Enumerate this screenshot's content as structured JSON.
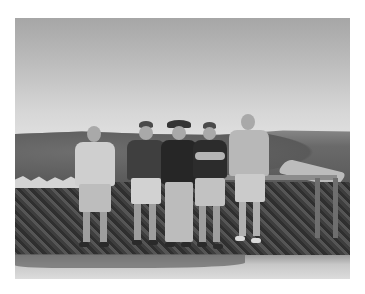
{
  "image": {
    "description": "Black-and-white photograph of five men standing in a row in front of a stone wall and wooden railing at a scenic overlook, with wooded hills and a river valley behind them under a bright hazy sky.",
    "color_mode": "grayscale",
    "scene": {
      "sky": "hazy, bright, gradient lighter toward horizon",
      "background": "wooded hills with a river bend on the right",
      "midground": "low stone wall with wooden railing on the right",
      "foreground": "sunlit paved ground with shadows"
    },
    "people": [
      {
        "position": 1,
        "clothing": "light short-sleeve button shirt, light shorts",
        "headwear": "none",
        "accessories": "sunglasses"
      },
      {
        "position": 2,
        "clothing": "dark polo shirt, light shorts",
        "headwear": "baseball cap"
      },
      {
        "position": 3,
        "clothing": "dark graphic t-shirt, light long pants",
        "headwear": "wide-brim hat"
      },
      {
        "position": 4,
        "clothing": "dark t-shirt, light shorts, arms crossed",
        "headwear": "baseball cap"
      },
      {
        "position": 5,
        "clothing": "light t-shirt, light shorts",
        "headwear": "none",
        "accessories": "sunglasses"
      }
    ],
    "colors": {
      "page_background": "#ffffff",
      "sky_top": "#a6a6a6",
      "sky_horizon": "#dedede",
      "hills": "#5a5a5a",
      "wall": "#444444",
      "ground": "#dcdcdc"
    }
  }
}
